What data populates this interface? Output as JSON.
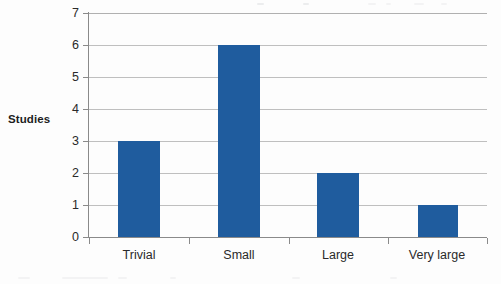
{
  "chart_data": {
    "type": "bar",
    "title": "",
    "subtitle": "",
    "xlabel": "",
    "ylabel": "Studies",
    "categories": [
      "Trivial",
      "Small",
      "Large",
      "Very large"
    ],
    "values": [
      3,
      6,
      2,
      1
    ],
    "series": [
      {
        "name": "Studies",
        "values": [
          3,
          6,
          2,
          1
        ]
      }
    ],
    "ylim": [
      0,
      7
    ],
    "ytick_labels": [
      "0",
      "1",
      "2",
      "3",
      "4",
      "5",
      "6",
      "7"
    ],
    "ytick_values": [
      0,
      1,
      2,
      3,
      4,
      5,
      6,
      7
    ],
    "grid": "horizontal",
    "legend": "none",
    "bar_color": "#1f5c9e",
    "gridline_color": "#bfbfbf",
    "axis_color": "#8a8a8a",
    "background_color": "#fdfdfd"
  }
}
